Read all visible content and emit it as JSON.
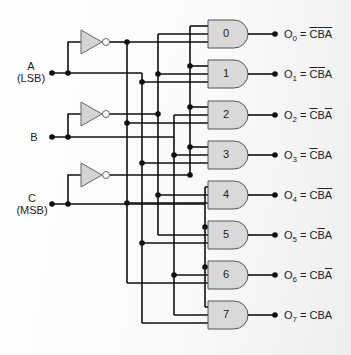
{
  "inputs": [
    {
      "name": "A",
      "note": "(LSB)"
    },
    {
      "name": "B",
      "note": ""
    },
    {
      "name": "C",
      "note": "(MSB)"
    }
  ],
  "gates": [
    {
      "number": "0",
      "output": "O",
      "index": "0",
      "expr": [
        {
          "t": "C",
          "bar": true
        },
        {
          "t": "B",
          "bar": true
        },
        {
          "t": "A",
          "bar": true
        }
      ]
    },
    {
      "number": "1",
      "output": "O",
      "index": "1",
      "expr": [
        {
          "t": "C",
          "bar": true
        },
        {
          "t": "B",
          "bar": true
        },
        {
          "t": "A",
          "bar": false
        }
      ]
    },
    {
      "number": "2",
      "output": "O",
      "index": "2",
      "expr": [
        {
          "t": "C",
          "bar": true
        },
        {
          "t": "B",
          "bar": false
        },
        {
          "t": "A",
          "bar": true
        }
      ]
    },
    {
      "number": "3",
      "output": "O",
      "index": "3",
      "expr": [
        {
          "t": "C",
          "bar": true
        },
        {
          "t": "B",
          "bar": false
        },
        {
          "t": "A",
          "bar": false
        }
      ]
    },
    {
      "number": "4",
      "output": "O",
      "index": "4",
      "expr": [
        {
          "t": "C",
          "bar": false
        },
        {
          "t": "B",
          "bar": true
        },
        {
          "t": "A",
          "bar": true
        }
      ]
    },
    {
      "number": "5",
      "output": "O",
      "index": "5",
      "expr": [
        {
          "t": "C",
          "bar": false
        },
        {
          "t": "B",
          "bar": true
        },
        {
          "t": "A",
          "bar": false
        }
      ]
    },
    {
      "number": "6",
      "output": "O",
      "index": "6",
      "expr": [
        {
          "t": "C",
          "bar": false
        },
        {
          "t": "B",
          "bar": false
        },
        {
          "t": "A",
          "bar": true
        }
      ]
    },
    {
      "number": "7",
      "output": "O",
      "index": "7",
      "expr": [
        {
          "t": "C",
          "bar": false
        },
        {
          "t": "B",
          "bar": false
        },
        {
          "t": "A",
          "bar": false
        }
      ]
    }
  ],
  "equals": "=",
  "colors": {
    "wire": "#111111",
    "gate_fill": "#d9d9d9",
    "gate_stroke": "#555555",
    "inverter_fill": "#d4d4d4"
  }
}
